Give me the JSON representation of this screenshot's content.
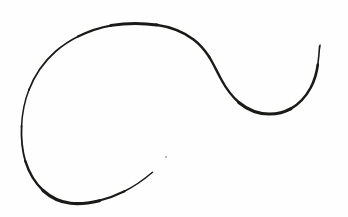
{
  "artwork": {
    "title": "hand-drawn spiral flourish",
    "type": "line-drawing",
    "caption": "",
    "background_color": "#fefefe",
    "ink_color": "#1a1a18",
    "canvas": {
      "width": 348,
      "height": 217
    },
    "strokes": [
      {
        "name": "main-flourish-stroke",
        "description": "single continuous tapering ink line forming a large open spiral on the left that sweeps over a broad arch, descends through an S-bend to a trough on the right, then curls upward into a small hook",
        "start_point": [
          152,
          172
        ],
        "end_point": [
          320,
          45
        ],
        "stroke_width_min": 1.3,
        "stroke_width_max": 3.4,
        "path": "M 152.5 172.2 C 141 181.5 128 190.8 114.5 196.6 C 101.5 202.2 88.5 205.0 77.0 204.0 C 64.0 202.9 52.0 197.2 42.5 188.0 C 32.0 177.8 25.0 163.5 22.0 148.0 C 19.0 132.5 19.8 116.0 23.8 100.5 C 28.5 82.5 38.0 65.5 51.5 51.5 C 66.0 36.5 85.0 26.8 105.5 24.0 C 124.0 21.5 143.5 22.8 160.5 27.5 C 176.0 31.8 189.0 39.5 198.5 49.5 C 207.0 58.4 212.5 69.5 218.5 80.0 C 226.0 93.2 235.5 104.0 248.0 110.5 C 259.5 116.5 273.0 117.5 285.5 113.5 C 297.0 109.8 306.5 101.5 312.5 91.0 C 318.5 80.5 321.0 68.5 320.3 56.5 C 320.0 51.5 319.6 48.0 319.5 45.3"
      },
      {
        "name": "ink-speck",
        "description": "tiny faint stray ink speck inside the spiral opening",
        "center": [
          166,
          157
        ],
        "radius": 1.2,
        "color": "#b9b9b6"
      }
    ]
  }
}
